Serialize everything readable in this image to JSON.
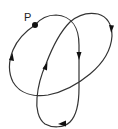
{
  "diagram": {
    "point": {
      "label": "P",
      "x": 35,
      "y": 25
    },
    "label_position": {
      "x": 24,
      "y": 20
    },
    "colors": {
      "stroke": "#333333",
      "point": "#111111",
      "background": "#ffffff"
    },
    "arrows": [
      {
        "name": "arrow-vertical-strand",
        "x": 79,
        "y": 57,
        "direction": "down"
      },
      {
        "name": "arrow-right-loop",
        "x": 111,
        "y": 30,
        "direction": "down"
      },
      {
        "name": "arrow-bottom-loop",
        "x": 62,
        "y": 124,
        "direction": "left"
      },
      {
        "name": "arrow-diagonal",
        "x": 45,
        "y": 67,
        "direction": "up-right"
      },
      {
        "name": "arrow-left-loop",
        "x": 11,
        "y": 57,
        "direction": "up"
      }
    ]
  }
}
